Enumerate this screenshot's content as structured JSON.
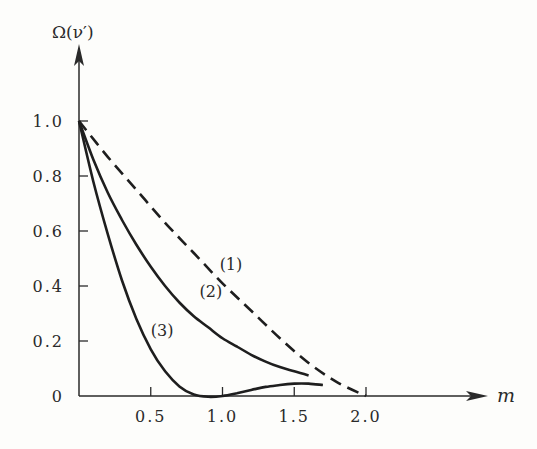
{
  "chart_data": {
    "type": "line",
    "title": "",
    "xlabel": "m",
    "ylabel": "Ω(ν′)",
    "xlim": [
      0,
      2.5
    ],
    "ylim": [
      0,
      1.1
    ],
    "grid": false,
    "legend": "inline curve labels",
    "x_ticks": [
      {
        "value": 0.5,
        "label": "0.5"
      },
      {
        "value": 1.0,
        "label": "1.0"
      },
      {
        "value": 1.5,
        "label": "1.5"
      },
      {
        "value": 2.0,
        "label": "2.0"
      }
    ],
    "y_ticks": [
      {
        "value": 0,
        "label": "0"
      },
      {
        "value": 0.2,
        "label": "0.2"
      },
      {
        "value": 0.4,
        "label": "0.4"
      },
      {
        "value": 0.6,
        "label": "0.6"
      },
      {
        "value": 0.8,
        "label": "0.8"
      },
      {
        "value": 1.0,
        "label": "1.0"
      }
    ],
    "series": [
      {
        "name": "(1)",
        "style": "dashed",
        "x": [
          0.0,
          0.2,
          0.4,
          0.6,
          0.8,
          1.0,
          1.2,
          1.4,
          1.6,
          1.8,
          2.0
        ],
        "values": [
          1.0,
          0.87,
          0.75,
          0.63,
          0.52,
          0.41,
          0.31,
          0.21,
          0.12,
          0.05,
          0.0
        ],
        "label_pos": [
          0.98,
          0.46
        ]
      },
      {
        "name": "(2)",
        "style": "solid",
        "x": [
          0.0,
          0.1,
          0.2,
          0.3,
          0.4,
          0.5,
          0.6,
          0.7,
          0.8,
          0.9,
          1.0,
          1.1,
          1.2,
          1.3,
          1.4,
          1.5,
          1.6
        ],
        "values": [
          1.0,
          0.86,
          0.74,
          0.64,
          0.55,
          0.47,
          0.4,
          0.34,
          0.29,
          0.25,
          0.21,
          0.18,
          0.15,
          0.125,
          0.105,
          0.09,
          0.075
        ],
        "label_pos": [
          0.84,
          0.36
        ]
      },
      {
        "name": "(3)",
        "style": "solid",
        "x": [
          0.0,
          0.1,
          0.2,
          0.3,
          0.4,
          0.5,
          0.6,
          0.7,
          0.8,
          0.9,
          1.0,
          1.1,
          1.2,
          1.3,
          1.4,
          1.5,
          1.6,
          1.7
        ],
        "values": [
          1.0,
          0.78,
          0.59,
          0.42,
          0.28,
          0.17,
          0.09,
          0.035,
          0.005,
          -0.003,
          0.0,
          0.01,
          0.022,
          0.033,
          0.04,
          0.045,
          0.045,
          0.04
        ],
        "label_pos": [
          0.5,
          0.22
        ]
      }
    ]
  },
  "labels": {
    "y_axis_title": "Ω(ν′)",
    "x_axis_title": "m"
  }
}
